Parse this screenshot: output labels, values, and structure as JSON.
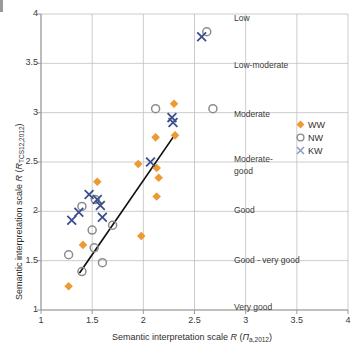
{
  "figure": {
    "width": 362,
    "height": 358,
    "background": "#ffffff"
  },
  "axes": {
    "x_title_prefix": "Semantic interpretation scale ",
    "x_title_r": "R",
    "x_title_paren_open": " (",
    "x_title_var": "Π",
    "x_title_sub": "a,2012",
    "x_title_paren_close": ")",
    "y_title_prefix": "Semantic interpretation scale ",
    "y_title_r": "R",
    "y_title_paren_open": " (",
    "y_title_var": "R",
    "y_title_sub": "TCS12,2012",
    "y_title_paren_close": ")"
  },
  "chart_data": {
    "type": "scatter",
    "title": "",
    "xlabel": "Semantic interpretation scale R (Πa,2012)",
    "ylabel": "Semantic interpretation scale R (RTCS12,2012)",
    "xlim": [
      1,
      4
    ],
    "ylim": [
      1,
      4
    ],
    "xticks": [
      1,
      1.5,
      2,
      2.5,
      3,
      3.5,
      4
    ],
    "yticks": [
      1,
      1.5,
      2,
      2.5,
      3,
      3.5,
      4
    ],
    "xticklabels": [
      "1",
      "1.5",
      "2",
      "2.5",
      "3",
      "3.5",
      "4"
    ],
    "yticklabels": [
      "1",
      "1.5",
      "2",
      "2.5",
      "3",
      "3.5",
      "4"
    ],
    "grid": true,
    "legend_position": "right-middle",
    "category_labels": [
      {
        "text": "Low",
        "y": 3.95
      },
      {
        "text": "Low-moderate",
        "y": 3.47
      },
      {
        "text": "Moderate",
        "y": 2.98
      },
      {
        "text": "Moderate-",
        "y": 2.52
      },
      {
        "text": "good",
        "y": 2.4
      },
      {
        "text": "Good",
        "y": 2.0
      },
      {
        "text": "Good - very good",
        "y": 1.5
      },
      {
        "text": "Very good",
        "y": 1.02
      }
    ],
    "colors": {
      "WW": "#ED9A34",
      "NW": "#8C8C8C",
      "KW": "#3B4E8E",
      "trendline": "#111111",
      "grid": "#BFBFBF",
      "axis": "#808080",
      "text": "#3a3a3a"
    },
    "series": [
      {
        "name": "WW",
        "marker": "diamond",
        "color": "#ED9A34",
        "points": [
          {
            "x": 1.27,
            "y": 1.24
          },
          {
            "x": 1.41,
            "y": 1.66
          },
          {
            "x": 1.55,
            "y": 2.3
          },
          {
            "x": 1.95,
            "y": 2.48
          },
          {
            "x": 1.98,
            "y": 1.75
          },
          {
            "x": 2.12,
            "y": 2.75
          },
          {
            "x": 2.13,
            "y": 2.44
          },
          {
            "x": 2.15,
            "y": 2.34
          },
          {
            "x": 2.13,
            "y": 2.15
          },
          {
            "x": 2.3,
            "y": 3.09
          },
          {
            "x": 2.31,
            "y": 2.77
          }
        ]
      },
      {
        "name": "NW",
        "marker": "circle",
        "color": "#8C8C8C",
        "points": [
          {
            "x": 1.27,
            "y": 1.56
          },
          {
            "x": 1.4,
            "y": 1.39
          },
          {
            "x": 1.4,
            "y": 2.05
          },
          {
            "x": 1.5,
            "y": 1.81
          },
          {
            "x": 1.52,
            "y": 1.63
          },
          {
            "x": 1.53,
            "y": 2.12
          },
          {
            "x": 1.6,
            "y": 1.48
          },
          {
            "x": 1.7,
            "y": 1.86
          },
          {
            "x": 2.12,
            "y": 3.04
          },
          {
            "x": 2.62,
            "y": 3.82
          },
          {
            "x": 2.68,
            "y": 3.04
          }
        ]
      },
      {
        "name": "KW",
        "marker": "x",
        "color": "#3B4E8E",
        "points": [
          {
            "x": 1.3,
            "y": 1.91
          },
          {
            "x": 1.37,
            "y": 1.99
          },
          {
            "x": 1.47,
            "y": 2.17
          },
          {
            "x": 1.55,
            "y": 2.12
          },
          {
            "x": 1.58,
            "y": 2.06
          },
          {
            "x": 1.6,
            "y": 1.94
          },
          {
            "x": 2.07,
            "y": 2.5
          },
          {
            "x": 2.28,
            "y": 2.95
          },
          {
            "x": 2.29,
            "y": 2.9
          },
          {
            "x": 2.57,
            "y": 3.77
          }
        ]
      }
    ],
    "trendline": {
      "x0": 1.38,
      "y0": 1.38,
      "x1": 2.31,
      "y1": 2.78
    }
  },
  "legend": {
    "items": [
      {
        "label": "WW",
        "marker": "diamond",
        "color": "#ED9A34"
      },
      {
        "label": "NW",
        "marker": "circle",
        "color": "#8C8C8C"
      },
      {
        "label": "KW",
        "marker": "x",
        "color": "#8C9BC4"
      }
    ]
  }
}
